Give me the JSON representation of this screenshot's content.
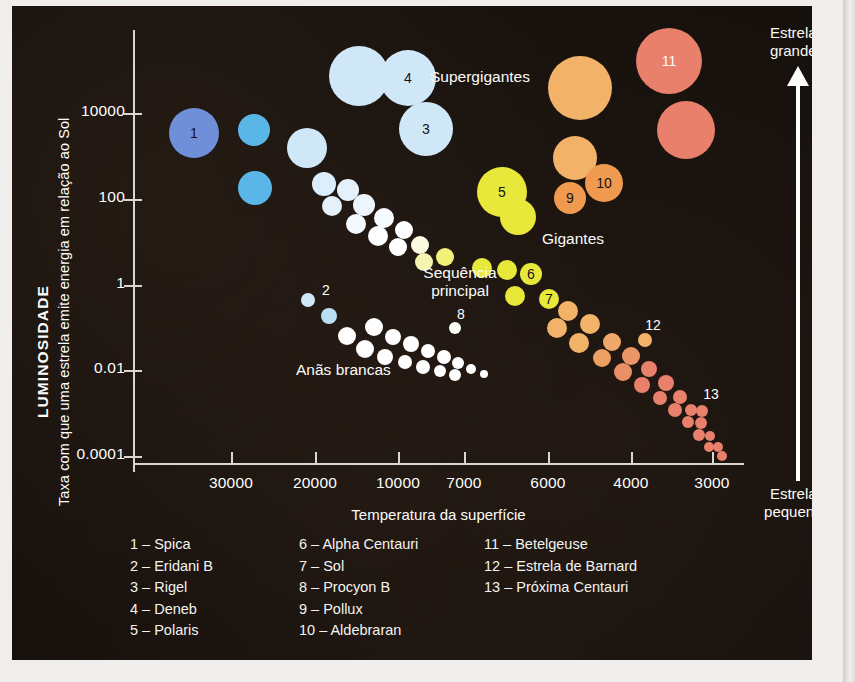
{
  "figure": {
    "background": "#17110d",
    "axis_color": "#d8d6d0"
  },
  "axes": {
    "y_title_main": "LUMINOSIDADE",
    "y_title_sub": "Taxa com que uma estrela emite energia em relação ao Sol",
    "x_title": "Temperatura da superfície",
    "y_ticks": [
      "10000",
      "100",
      "1",
      "0.01",
      "0.0001"
    ],
    "x_ticks": [
      "30000",
      "20000",
      "10000",
      "7000",
      "6000",
      "4000",
      "3000"
    ]
  },
  "annotations": {
    "supergiants": "Supergigantes",
    "giants": "Gigantes",
    "main_sequence": "Sequência\nprincipal",
    "white_dwarfs": "Anãs brancas",
    "big_stars": "Estrelas\ngrandes",
    "small_stars": "Estrelas\npequenas"
  },
  "legend": {
    "col1": [
      "1 – Spica",
      "2 – Eridani B",
      "3 – Rigel",
      "4 – Deneb",
      "5 – Polaris"
    ],
    "col2": [
      "6 – Alpha Centauri",
      "7 – Sol",
      "8 – Procyon B",
      "9 – Pollux",
      "10 – Aldebraran"
    ],
    "col3": [
      "11 – Betelgeuse",
      "12 – Estrela de Barnard",
      "13 – Próxima Centauri"
    ]
  },
  "chart_data": {
    "type": "scatter",
    "xlabel": "Temperatura da superfície",
    "ylabel": "LUMINOSIDADE",
    "xlim": [
      32000,
      2800
    ],
    "ylim": [
      2e-05,
      200000
    ],
    "x_tick_values": [
      30000,
      20000,
      10000,
      7000,
      6000,
      4000,
      3000
    ],
    "y_tick_values": [
      10000,
      100,
      1,
      0.01,
      0.0001
    ],
    "grid": false,
    "legend_position": "bottom",
    "colors": {
      "blue_deep": "#6f8fd8",
      "blue": "#6cc0ea",
      "blue_pale": "#cfe7f7",
      "white": "#fdfdfb",
      "yellow": "#e8e83a",
      "orange": "#f2b268",
      "orange_deep": "#ef9a4e",
      "salmon": "#e8806b"
    },
    "numbered_stars": [
      {
        "n": 1,
        "name": "Spica",
        "px": 182,
        "py": 127,
        "r": 25,
        "color": "#6f8fd8",
        "label": "inside"
      },
      {
        "n": 2,
        "name": "Eridani B",
        "px": 296,
        "py": 294,
        "r": 7,
        "color": "#cfe7f7",
        "label": "outside"
      },
      {
        "n": 3,
        "name": "Rigel",
        "px": 414,
        "py": 123,
        "r": 27,
        "color": "#cfe7f7",
        "label": "inside"
      },
      {
        "n": 4,
        "name": "Deneb",
        "px": 396,
        "py": 72,
        "r": 28,
        "color": "#cfe7f7",
        "label": "inside"
      },
      {
        "n": 5,
        "name": "Polaris",
        "px": 490,
        "py": 186,
        "r": 25,
        "color": "#e8e83a",
        "label": "inside"
      },
      {
        "n": 6,
        "name": "Alpha Centauri",
        "px": 519,
        "py": 268,
        "r": 11,
        "color": "#e8e83a",
        "label": "inside"
      },
      {
        "n": 7,
        "name": "Sol",
        "px": 537,
        "py": 293,
        "r": 10,
        "color": "#e8e83a",
        "label": "inside"
      },
      {
        "n": 8,
        "name": "Procyon B",
        "px": 443,
        "py": 322,
        "r": 6,
        "color": "#fdfdfb",
        "label": "outside"
      },
      {
        "n": 9,
        "name": "Pollux",
        "px": 558,
        "py": 192,
        "r": 16,
        "color": "#ef9a4e",
        "label": "inside"
      },
      {
        "n": 10,
        "name": "Aldebraran",
        "px": 592,
        "py": 177,
        "r": 19,
        "color": "#ef9a4e",
        "label": "inside"
      },
      {
        "n": 11,
        "name": "Betelgeuse",
        "px": 657,
        "py": 55,
        "r": 33,
        "color": "#e8806b",
        "label": "inside-light"
      },
      {
        "n": 12,
        "name": "Estrela de Barnard",
        "px": 633,
        "py": 334,
        "r": 7,
        "color": "#f2b268",
        "label": "outside"
      },
      {
        "n": 13,
        "name": "Próxima Centauri",
        "px": 690,
        "py": 405,
        "r": 6,
        "color": "#e8806b",
        "label": "outside"
      }
    ],
    "main_sequence": [
      {
        "px": 242,
        "py": 124,
        "r": 16,
        "color": "#5bb6e8"
      },
      {
        "px": 243,
        "py": 182,
        "r": 17,
        "color": "#5bb6e8"
      },
      {
        "px": 295,
        "py": 142,
        "r": 20,
        "color": "#cfe7f7"
      },
      {
        "px": 312,
        "py": 178,
        "r": 12,
        "color": "#dbeefb"
      },
      {
        "px": 336,
        "py": 184,
        "r": 11,
        "color": "#e4f1fb"
      },
      {
        "px": 320,
        "py": 200,
        "r": 10,
        "color": "#e4f1fb"
      },
      {
        "px": 352,
        "py": 199,
        "r": 11,
        "color": "#edf6fd"
      },
      {
        "px": 344,
        "py": 218,
        "r": 10,
        "color": "#f3f9fe"
      },
      {
        "px": 372,
        "py": 212,
        "r": 10,
        "color": "#f6fbff"
      },
      {
        "px": 366,
        "py": 230,
        "r": 10,
        "color": "#fbfdff"
      },
      {
        "px": 392,
        "py": 224,
        "r": 9,
        "color": "#ffffff"
      },
      {
        "px": 386,
        "py": 241,
        "r": 9,
        "color": "#ffffff"
      },
      {
        "px": 408,
        "py": 239,
        "r": 9,
        "color": "#fbfbe0"
      },
      {
        "px": 412,
        "py": 256,
        "r": 9,
        "color": "#f5f5b0"
      },
      {
        "px": 433,
        "py": 251,
        "r": 9,
        "color": "#f2f27a"
      },
      {
        "px": 470,
        "py": 262,
        "r": 10,
        "color": "#e8e83a"
      },
      {
        "px": 495,
        "py": 264,
        "r": 10,
        "color": "#e8e83a"
      },
      {
        "px": 503,
        "py": 290,
        "r": 10,
        "color": "#e8e83a"
      },
      {
        "px": 556,
        "py": 305,
        "r": 10,
        "color": "#f2b268"
      },
      {
        "px": 545,
        "py": 322,
        "r": 10,
        "color": "#f2b268"
      },
      {
        "px": 578,
        "py": 318,
        "r": 10,
        "color": "#f2b268"
      },
      {
        "px": 567,
        "py": 337,
        "r": 10,
        "color": "#f2b268"
      },
      {
        "px": 600,
        "py": 336,
        "r": 9,
        "color": "#f0a86a"
      },
      {
        "px": 590,
        "py": 352,
        "r": 9,
        "color": "#eda060"
      },
      {
        "px": 619,
        "py": 350,
        "r": 9,
        "color": "#ec9566"
      },
      {
        "px": 611,
        "py": 366,
        "r": 9,
        "color": "#ea8f66"
      },
      {
        "px": 637,
        "py": 363,
        "r": 8,
        "color": "#e8806b"
      },
      {
        "px": 630,
        "py": 379,
        "r": 8,
        "color": "#e8806b"
      },
      {
        "px": 654,
        "py": 377,
        "r": 8,
        "color": "#e8806b"
      },
      {
        "px": 648,
        "py": 392,
        "r": 7,
        "color": "#e8806b"
      },
      {
        "px": 668,
        "py": 391,
        "r": 7,
        "color": "#e8806b"
      },
      {
        "px": 663,
        "py": 404,
        "r": 7,
        "color": "#e8806b"
      },
      {
        "px": 679,
        "py": 404,
        "r": 6,
        "color": "#e8806b"
      },
      {
        "px": 676,
        "py": 416,
        "r": 6,
        "color": "#e8806b"
      },
      {
        "px": 689,
        "py": 417,
        "r": 6,
        "color": "#e8806b"
      },
      {
        "px": 687,
        "py": 429,
        "r": 6,
        "color": "#e8806b"
      },
      {
        "px": 698,
        "py": 430,
        "r": 5,
        "color": "#e8806b"
      },
      {
        "px": 697,
        "py": 441,
        "r": 5,
        "color": "#e8806b"
      },
      {
        "px": 706,
        "py": 441,
        "r": 5,
        "color": "#e8806b"
      },
      {
        "px": 710,
        "py": 450,
        "r": 5,
        "color": "#e8806b"
      }
    ],
    "supergiant_cluster": [
      {
        "px": 347,
        "py": 70,
        "r": 30,
        "color": "#cfe7f7"
      },
      {
        "px": 568,
        "py": 82,
        "r": 32,
        "color": "#f2b268"
      },
      {
        "px": 563,
        "py": 152,
        "r": 22,
        "color": "#f2b268"
      },
      {
        "px": 674,
        "py": 124,
        "r": 29,
        "color": "#e8806b"
      },
      {
        "px": 506,
        "py": 211,
        "r": 18,
        "color": "#e8e83a"
      }
    ],
    "white_dwarfs": [
      {
        "px": 317,
        "py": 310,
        "r": 8,
        "color": "#b9dff5"
      },
      {
        "px": 335,
        "py": 330,
        "r": 9,
        "color": "#ffffff"
      },
      {
        "px": 362,
        "py": 321,
        "r": 9,
        "color": "#ffffff"
      },
      {
        "px": 353,
        "py": 343,
        "r": 9,
        "color": "#ffffff"
      },
      {
        "px": 381,
        "py": 331,
        "r": 8,
        "color": "#ffffff"
      },
      {
        "px": 373,
        "py": 351,
        "r": 8,
        "color": "#ffffff"
      },
      {
        "px": 399,
        "py": 338,
        "r": 8,
        "color": "#ffffff"
      },
      {
        "px": 393,
        "py": 356,
        "r": 7,
        "color": "#ffffff"
      },
      {
        "px": 416,
        "py": 345,
        "r": 7,
        "color": "#ffffff"
      },
      {
        "px": 411,
        "py": 361,
        "r": 7,
        "color": "#ffffff"
      },
      {
        "px": 432,
        "py": 351,
        "r": 7,
        "color": "#ffffff"
      },
      {
        "px": 428,
        "py": 365,
        "r": 6,
        "color": "#ffffff"
      },
      {
        "px": 446,
        "py": 357,
        "r": 6,
        "color": "#ffffff"
      },
      {
        "px": 443,
        "py": 369,
        "r": 6,
        "color": "#ffffff"
      },
      {
        "px": 459,
        "py": 363,
        "r": 5,
        "color": "#ffffff"
      },
      {
        "px": 472,
        "py": 368,
        "r": 4,
        "color": "#ffffff"
      }
    ]
  }
}
